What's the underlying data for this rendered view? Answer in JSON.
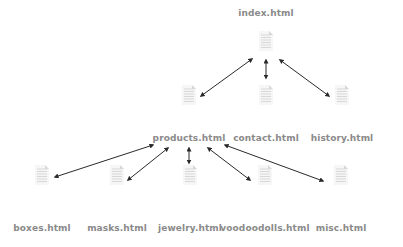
{
  "diagram": {
    "type": "sitemap",
    "nodes": [
      {
        "id": "index",
        "label": "index.html",
        "x": 266,
        "y": 44,
        "lx": 266,
        "ly": 8
      },
      {
        "id": "products",
        "label": "products.html",
        "x": 189,
        "y": 98,
        "lx": 189,
        "ly": 133
      },
      {
        "id": "contact",
        "label": "contact.html",
        "x": 266,
        "y": 98,
        "lx": 266,
        "ly": 133
      },
      {
        "id": "history",
        "label": "history.html",
        "x": 342,
        "y": 98,
        "lx": 342,
        "ly": 133
      },
      {
        "id": "boxes",
        "label": "boxes.html",
        "x": 42,
        "y": 178,
        "lx": 42,
        "ly": 223
      },
      {
        "id": "masks",
        "label": "masks.html",
        "x": 117,
        "y": 178,
        "lx": 117,
        "ly": 223
      },
      {
        "id": "jewelry",
        "label": "jewelry.html",
        "x": 190,
        "y": 178,
        "lx": 190,
        "ly": 223
      },
      {
        "id": "voodoodolls",
        "label": "voodoodolls.html",
        "x": 265,
        "y": 178,
        "lx": 265,
        "ly": 223
      },
      {
        "id": "misc",
        "label": "misc.html",
        "x": 341,
        "y": 178,
        "lx": 341,
        "ly": 223
      }
    ],
    "edges": [
      {
        "from": "index",
        "to": "products",
        "x1": 252,
        "y1": 59,
        "x2": 201,
        "y2": 96
      },
      {
        "from": "index",
        "to": "contact",
        "x1": 266,
        "y1": 60,
        "x2": 266,
        "y2": 78
      },
      {
        "from": "index",
        "to": "history",
        "x1": 280,
        "y1": 60,
        "x2": 329,
        "y2": 96
      },
      {
        "from": "products",
        "to": "boxes",
        "x1": 153,
        "y1": 145,
        "x2": 55,
        "y2": 177
      },
      {
        "from": "products",
        "to": "masks",
        "x1": 168,
        "y1": 148,
        "x2": 128,
        "y2": 180
      },
      {
        "from": "products",
        "to": "jewelry",
        "x1": 189,
        "y1": 148,
        "x2": 189,
        "y2": 163
      },
      {
        "from": "products",
        "to": "voodoodolls",
        "x1": 208,
        "y1": 148,
        "x2": 250,
        "y2": 180
      },
      {
        "from": "products",
        "to": "misc",
        "x1": 225,
        "y1": 145,
        "x2": 323,
        "y2": 181
      }
    ],
    "colors": {
      "arrow": "#2a2a2a",
      "doc": "#d8d8d8",
      "label": "#8a8a8a"
    },
    "icon": "document-icon"
  }
}
